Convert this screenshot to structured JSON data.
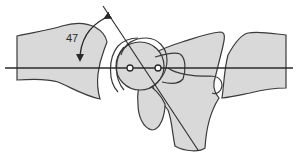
{
  "diagram": {
    "angle_label": "47",
    "colors": {
      "bone_fill": "#d9d9d9",
      "outline": "#3a3a3a",
      "line": "#2a2a2a",
      "background": "#ffffff"
    }
  }
}
